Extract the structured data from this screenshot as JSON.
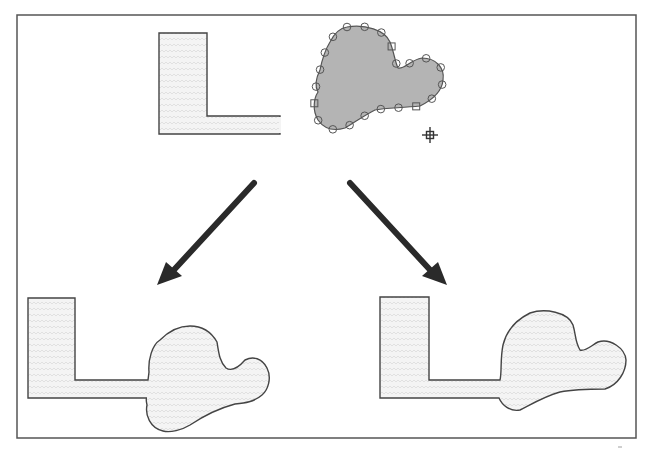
{
  "diagram": {
    "colors": {
      "frame": "#555555",
      "outline": "#444444",
      "selected_fill": "#b4b4b4",
      "pattern_fill": "#f2f2f2",
      "arrow": "#2a2a2a"
    },
    "top": {
      "l_shape": {
        "label": "l-shape-original"
      },
      "blob": {
        "label": "blob-selected",
        "selected": true,
        "handle_count": 22
      },
      "cursor": {
        "icon": "crosshair-icon"
      }
    },
    "arrows": [
      {
        "direction": "down-left",
        "target": "result-left"
      },
      {
        "direction": "down-right",
        "target": "result-right"
      }
    ],
    "results": [
      {
        "name": "result-left",
        "description": "L-shape merged with blob"
      },
      {
        "name": "result-right",
        "description": "L-shape merged with blob (variant)"
      }
    ]
  }
}
